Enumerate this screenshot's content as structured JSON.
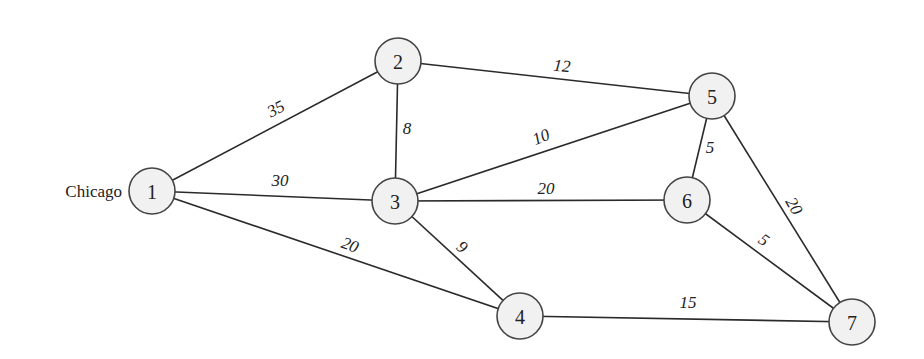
{
  "diagram": {
    "type": "weighted-undirected-graph",
    "source_label": {
      "text": "Chicago",
      "node": "1",
      "x": 122,
      "y": 191
    },
    "nodes": [
      {
        "id": "1",
        "label": "1",
        "x": 152,
        "y": 191
      },
      {
        "id": "2",
        "label": "2",
        "x": 398,
        "y": 61
      },
      {
        "id": "3",
        "label": "3",
        "x": 395,
        "y": 201
      },
      {
        "id": "4",
        "label": "4",
        "x": 520,
        "y": 316
      },
      {
        "id": "5",
        "label": "5",
        "x": 712,
        "y": 96
      },
      {
        "id": "6",
        "label": "6",
        "x": 687,
        "y": 200
      },
      {
        "id": "7",
        "label": "7",
        "x": 852,
        "y": 322
      }
    ],
    "node_radius": 23,
    "edges": [
      {
        "from": "1",
        "to": "2",
        "weight": "35",
        "lx": 276,
        "ly": 109,
        "rot": -28
      },
      {
        "from": "1",
        "to": "3",
        "weight": "30",
        "lx": 280,
        "ly": 180,
        "rot": 0
      },
      {
        "from": "1",
        "to": "4",
        "weight": "20",
        "lx": 350,
        "ly": 245,
        "rot": 20
      },
      {
        "from": "2",
        "to": "3",
        "weight": "8",
        "lx": 407,
        "ly": 128,
        "rot": 0
      },
      {
        "from": "2",
        "to": "5",
        "weight": "12",
        "lx": 562,
        "ly": 66,
        "rot": 5
      },
      {
        "from": "3",
        "to": "5",
        "weight": "10",
        "lx": 541,
        "ly": 137,
        "rot": -22
      },
      {
        "from": "3",
        "to": "6",
        "weight": "20",
        "lx": 546,
        "ly": 188,
        "rot": 0
      },
      {
        "from": "3",
        "to": "4",
        "weight": "9",
        "lx": 462,
        "ly": 247,
        "rot": 40
      },
      {
        "from": "5",
        "to": "6",
        "weight": "5",
        "lx": 710,
        "ly": 147,
        "rot": 0
      },
      {
        "from": "5",
        "to": "7",
        "weight": "20",
        "lx": 794,
        "ly": 206,
        "rot": 60
      },
      {
        "from": "6",
        "to": "7",
        "weight": "5",
        "lx": 764,
        "ly": 240,
        "rot": 35
      },
      {
        "from": "4",
        "to": "7",
        "weight": "15",
        "lx": 688,
        "ly": 302,
        "rot": 0
      }
    ]
  },
  "colors": {
    "background": "#ffffff",
    "node_fill": "#f1f1f1",
    "node_stroke": "#444444",
    "edge": "#2a2a2a",
    "text": "#222222"
  }
}
